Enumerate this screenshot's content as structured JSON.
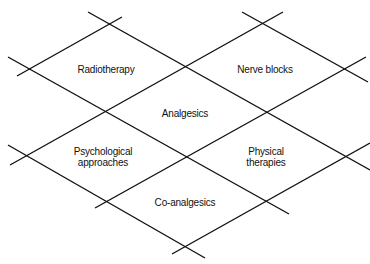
{
  "diagram": {
    "title": "",
    "line_color": "#111111",
    "text_color": "#111111",
    "background": "#ffffff",
    "lines": [
      {
        "id": "down-1",
        "x1": 88,
        "y1": 12,
        "x2": 370,
        "y2": 170
      },
      {
        "id": "down-2",
        "x1": 8,
        "y1": 57,
        "x2": 289,
        "y2": 214
      },
      {
        "id": "down-3",
        "x1": 8,
        "y1": 145,
        "x2": 205,
        "y2": 258
      },
      {
        "id": "down-4",
        "x1": 242,
        "y1": 12,
        "x2": 368,
        "y2": 82
      },
      {
        "id": "up-1",
        "x1": 17,
        "y1": 76,
        "x2": 122,
        "y2": 17
      },
      {
        "id": "up-2",
        "x1": 10,
        "y1": 165,
        "x2": 283,
        "y2": 12
      },
      {
        "id": "up-3",
        "x1": 95,
        "y1": 208,
        "x2": 366,
        "y2": 57
      },
      {
        "id": "up-4",
        "x1": 172,
        "y1": 254,
        "x2": 370,
        "y2": 143
      }
    ],
    "regions": [
      {
        "id": "radiotherapy",
        "lines": [
          "Radiotherapy"
        ],
        "x": 106,
        "y": 69
      },
      {
        "id": "nerve-blocks",
        "lines": [
          "Nerve blocks"
        ],
        "x": 265,
        "y": 69
      },
      {
        "id": "analgesics",
        "lines": [
          "Analgesics"
        ],
        "x": 185,
        "y": 113
      },
      {
        "id": "psychological-approaches",
        "lines": [
          "Psychological",
          "approaches"
        ],
        "x": 103,
        "y": 157
      },
      {
        "id": "physical-therapies",
        "lines": [
          "Physical",
          "therapies"
        ],
        "x": 266,
        "y": 157
      },
      {
        "id": "co-analgesics",
        "lines": [
          "Co-analgesics"
        ],
        "x": 185,
        "y": 202
      }
    ]
  }
}
